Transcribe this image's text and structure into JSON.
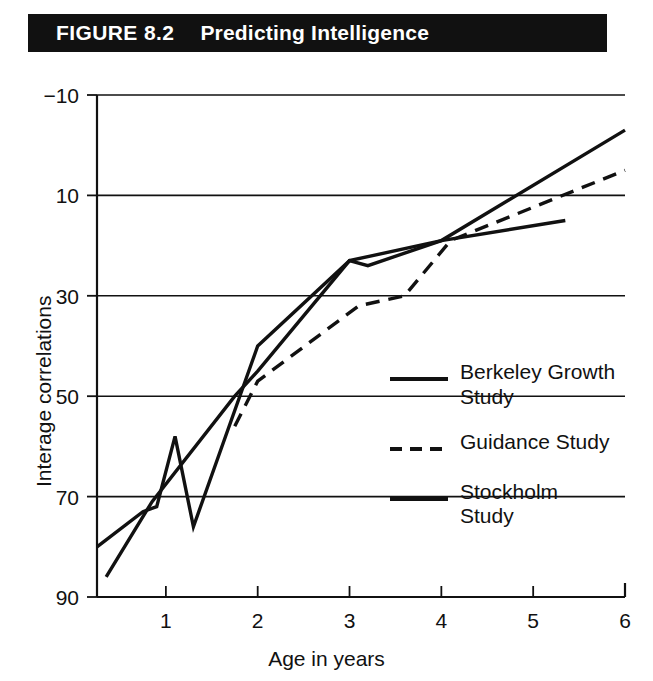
{
  "figure": {
    "label": "FIGURE 8.2",
    "name": "Predicting Intelligence"
  },
  "axes": {
    "x_title": "Age in years",
    "y_title": "Interage correlations",
    "x_ticks": [
      "1",
      "2",
      "3",
      "4",
      "5",
      "6"
    ],
    "y_ticks": [
      "90",
      "70",
      "50",
      "30",
      "10",
      "−10"
    ]
  },
  "legend": {
    "items": [
      {
        "label": "Berkeley Growth\nStudy",
        "style": "solid",
        "swatch": "solid-line-swatch"
      },
      {
        "label": "Guidance Study",
        "style": "dashed",
        "swatch": "dashed-line-swatch"
      },
      {
        "label": "Stockholm\nStudy",
        "style": "solid",
        "swatch": "solid-line-swatch"
      }
    ]
  },
  "colors": {
    "banner_background": "#111111",
    "banner_text": "#ffffff",
    "line": "#111111",
    "grid": "#111111",
    "plot_background": "#ffffff"
  },
  "chart_data": {
    "type": "line",
    "title": "Predicting Intelligence",
    "xlabel": "Age in years",
    "ylabel": "Interage correlations",
    "xlim": [
      0.25,
      6
    ],
    "ylim": [
      -10,
      90
    ],
    "x_ticks": [
      1,
      2,
      3,
      4,
      5,
      6
    ],
    "y_ticks": [
      -10,
      10,
      30,
      50,
      70,
      90
    ],
    "grid": "horizontal",
    "legend_position": "inside-right",
    "series": [
      {
        "name": "Berkeley Growth Study",
        "style": "solid",
        "points": [
          {
            "x": 0.25,
            "y": 0
          },
          {
            "x": 0.75,
            "y": 7
          },
          {
            "x": 0.9,
            "y": 8
          },
          {
            "x": 1.1,
            "y": 22
          },
          {
            "x": 1.3,
            "y": 4
          },
          {
            "x": 2.0,
            "y": 40
          },
          {
            "x": 3.0,
            "y": 57
          },
          {
            "x": 3.2,
            "y": 56
          },
          {
            "x": 4.0,
            "y": 61
          },
          {
            "x": 6.0,
            "y": 83
          }
        ]
      },
      {
        "name": "Guidance Study",
        "style": "dashed",
        "points": [
          {
            "x": 1.75,
            "y": 24
          },
          {
            "x": 2.0,
            "y": 33
          },
          {
            "x": 3.1,
            "y": 48
          },
          {
            "x": 3.6,
            "y": 50
          },
          {
            "x": 4.1,
            "y": 61
          },
          {
            "x": 6.0,
            "y": 75
          }
        ]
      },
      {
        "name": "Stockholm Study",
        "style": "solid",
        "points": [
          {
            "x": 0.35,
            "y": -6
          },
          {
            "x": 0.85,
            "y": 9
          },
          {
            "x": 1.75,
            "y": 30
          },
          {
            "x": 2.0,
            "y": 35
          },
          {
            "x": 3.0,
            "y": 57
          },
          {
            "x": 4.0,
            "y": 61
          },
          {
            "x": 5.35,
            "y": 65
          }
        ]
      }
    ]
  }
}
